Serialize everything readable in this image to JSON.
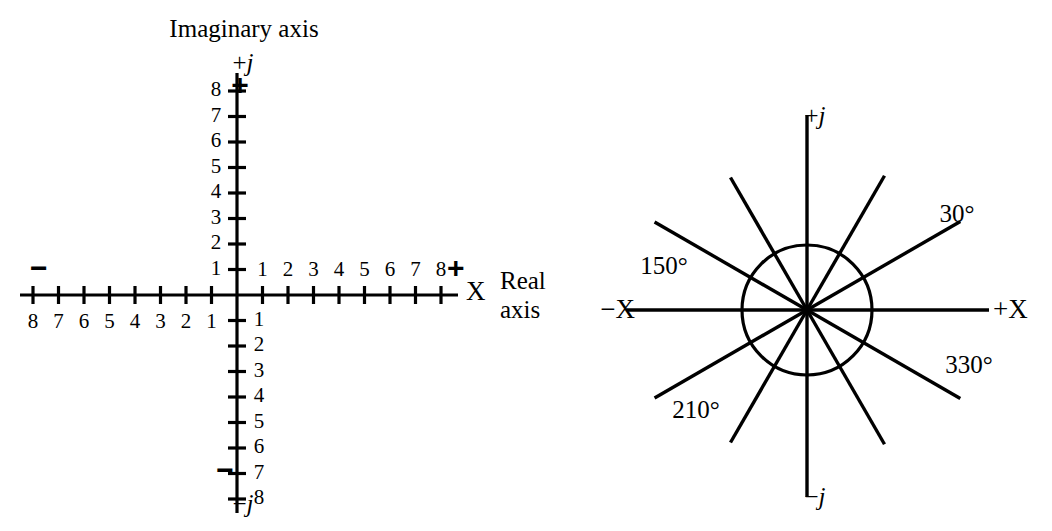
{
  "figure": {
    "background_color": "#ffffff",
    "stroke_color": "#000000"
  },
  "left_diagram": {
    "name": "complex-plane-cartesian",
    "imaginary_axis_title": "Imaginary axis",
    "real_axis_title_line1": "Real",
    "real_axis_title_line2": "axis",
    "x_axis_letter": "X",
    "positive_j_label": "+j",
    "negative_j_label": "−j",
    "top_plus_sign": "+",
    "bottom_minus_sign": "−",
    "left_minus_sign": "−",
    "right_plus_sign": "+",
    "x_positive_ticks": [
      "1",
      "2",
      "3",
      "4",
      "5",
      "6",
      "7",
      "8"
    ],
    "x_negative_ticks": [
      "8",
      "7",
      "6",
      "5",
      "4",
      "3",
      "2",
      "1"
    ],
    "y_positive_ticks": [
      "8",
      "7",
      "6",
      "5",
      "4",
      "3",
      "2",
      "1"
    ],
    "y_negative_ticks": [
      "1",
      "2",
      "3",
      "4",
      "5",
      "6",
      "7",
      "8"
    ],
    "origin_x": 237,
    "origin_y": 295,
    "tick_spacing": 25.5,
    "tick_count_per_side": 8
  },
  "right_diagram": {
    "name": "phasor-star-diagram",
    "positive_j_label": "+j",
    "negative_j_label": "−j",
    "negative_x_label": "−X",
    "positive_x_label": "+X",
    "center_x": 807,
    "center_y": 310,
    "circle_radius": 65,
    "angle_labels": [
      {
        "text": "30°",
        "angle_deg": 30
      },
      {
        "text": "150°",
        "angle_deg": 150
      },
      {
        "text": "210°",
        "angle_deg": 210
      },
      {
        "text": "330°",
        "angle_deg": 330
      }
    ],
    "ray_angles_deg": [
      0,
      30,
      60,
      90,
      120,
      150,
      180,
      210,
      240,
      270,
      300,
      330
    ]
  },
  "chart_data": {
    "type": "scatter",
    "title": "",
    "panels": [
      {
        "name": "complex-plane-axes",
        "xlabel": "Real axis",
        "ylabel": "Imaginary axis",
        "xlim": [
          -8,
          8
        ],
        "ylim": [
          -8,
          8
        ],
        "xticks": [
          -8,
          -7,
          -6,
          -5,
          -4,
          -3,
          -2,
          -1,
          1,
          2,
          3,
          4,
          5,
          6,
          7,
          8
        ],
        "yticks": [
          -8,
          -7,
          -6,
          -5,
          -4,
          -3,
          -2,
          -1,
          1,
          2,
          3,
          4,
          5,
          6,
          7,
          8
        ],
        "grid": false,
        "legend": "none",
        "annotations": [
          "+j",
          "−j",
          "X",
          "+",
          "−"
        ],
        "values": []
      },
      {
        "name": "phasor-star",
        "xlabel": "+X / −X",
        "ylabel": "+j / −j",
        "grid": false,
        "legend": "none",
        "unit_circle_radius": 1,
        "ray_angles_deg": [
          0,
          30,
          60,
          90,
          120,
          150,
          180,
          210,
          240,
          270,
          300,
          330
        ],
        "labeled_angles_deg": [
          30,
          150,
          210,
          330
        ],
        "annotations": [
          "30°",
          "150°",
          "210°",
          "330°",
          "+j",
          "−j",
          "+X",
          "−X"
        ],
        "values": []
      }
    ]
  }
}
